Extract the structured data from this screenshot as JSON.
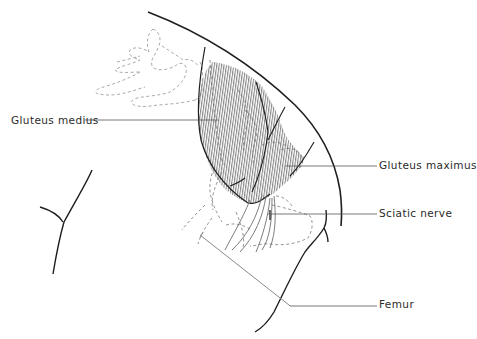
{
  "figure": {
    "type": "anatomical-line-drawing",
    "colors": {
      "outline": "#1e1e1e",
      "dashed": "#9a9a9a",
      "hatch": "#707070",
      "leader": "#555555",
      "background": "#ffffff"
    }
  },
  "labels": [
    {
      "id": "gluteus-medius",
      "text": "Gluteus medius"
    },
    {
      "id": "gluteus-maximus",
      "text": "Gluteus maximus"
    },
    {
      "id": "sciatic-nerve",
      "text": "Sciatic nerve"
    },
    {
      "id": "femur",
      "text": "Femur"
    }
  ]
}
